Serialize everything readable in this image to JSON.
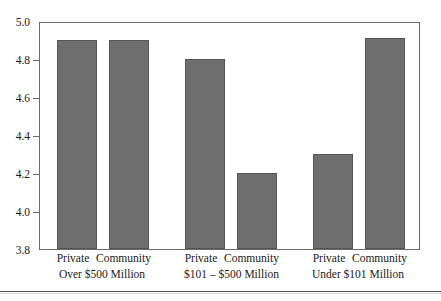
{
  "chart_data": {
    "type": "bar",
    "title": "",
    "subtitle": "",
    "xlabel": "",
    "ylabel": "",
    "ylim": [
      3.8,
      5.0
    ],
    "ytick_labels": [
      "5.0",
      "4.8",
      "4.6",
      "4.4",
      "4.2",
      "4.0",
      "3.8"
    ],
    "ytick_values": [
      5.0,
      4.8,
      4.6,
      4.4,
      4.2,
      4.0,
      3.8
    ],
    "grid": false,
    "legend": false,
    "bar_color": "#6e6e6e",
    "bar_edge_color": "#555555",
    "frame_color": "#6a6a6a",
    "categories": [
      "Private",
      "Community",
      "Private",
      "Community",
      "Private",
      "Community"
    ],
    "values": [
      4.9,
      4.9,
      4.8,
      4.2,
      4.3,
      4.91
    ],
    "groups": [
      {
        "title": "Over $500 Million",
        "bars": [
          {
            "label": "Private",
            "value": 4.9
          },
          {
            "label": "Community",
            "value": 4.9
          }
        ]
      },
      {
        "title": "$101 – $500 Million",
        "bars": [
          {
            "label": "Private",
            "value": 4.8
          },
          {
            "label": "Community",
            "value": 4.2
          }
        ]
      },
      {
        "title": "Under $101 Million",
        "bars": [
          {
            "label": "Private",
            "value": 4.3
          },
          {
            "label": "Community",
            "value": 4.91
          }
        ]
      }
    ]
  }
}
